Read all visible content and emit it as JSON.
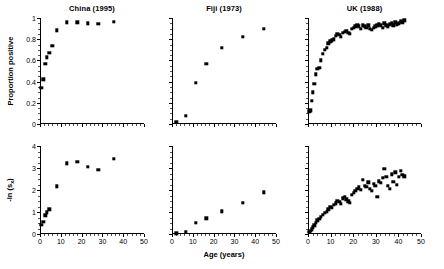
{
  "figure": {
    "axis_titles": {
      "y_top": "Proportion positive",
      "y_bottom": "-ln (s",
      "y_bottom_sub": "x",
      "y_bottom_tail": ")",
      "x": "Age (years)"
    },
    "marker_color": "#000000",
    "axis_color": "#000000"
  },
  "panels": [
    {
      "key": "china",
      "title": "China (1995)"
    },
    {
      "key": "fiji",
      "title": "Fiji (1973)"
    },
    {
      "key": "uk",
      "title": "UK (1988)"
    }
  ],
  "chart_data": [
    {
      "type": "scatter",
      "title": "China (1995)",
      "row": "top",
      "xlabel": "Age (years)",
      "ylabel": "Proportion positive",
      "xlim": [
        0,
        50
      ],
      "ylim": [
        0,
        1
      ],
      "xticks": [
        0,
        10,
        20,
        30,
        40,
        50
      ],
      "yticks": [
        0,
        0.2,
        0.4,
        0.6,
        0.8,
        1
      ],
      "xticklabels": [
        "0",
        "10",
        "20",
        "30",
        "40",
        "50"
      ],
      "yticklabels": [
        "0",
        "0.2",
        "0.4",
        "0.6",
        "0.8",
        "1"
      ],
      "grid": false,
      "legend": "none",
      "x": [
        0.7,
        1.6,
        2.6,
        3.4,
        4.5,
        6.0,
        8.0,
        13.0,
        18.0,
        23.0,
        28.0,
        35.5
      ],
      "y": [
        0.34,
        0.42,
        0.57,
        0.63,
        0.67,
        0.74,
        0.885,
        0.96,
        0.96,
        0.95,
        0.945,
        0.965
      ]
    },
    {
      "type": "scatter",
      "title": "Fiji (1973)",
      "row": "top",
      "xlabel": "Age (years)",
      "ylabel": "Proportion positive",
      "xlim": [
        0,
        50
      ],
      "ylim": [
        0,
        1
      ],
      "xticks": [
        0,
        10,
        20,
        30,
        40,
        50
      ],
      "yticks": [
        0,
        0.2,
        0.4,
        0.6,
        0.8,
        1
      ],
      "xticklabels": [
        "0",
        "10",
        "20",
        "30",
        "40",
        "50"
      ],
      "yticklabels": [
        "0",
        "0.2",
        "0.4",
        "0.6",
        "0.8",
        "1"
      ],
      "grid": false,
      "legend": "none",
      "x": [
        2.0,
        6.5,
        11.5,
        16.5,
        24.0,
        34.0,
        44.0
      ],
      "y": [
        0.02,
        0.08,
        0.39,
        0.57,
        0.72,
        0.82,
        0.9
      ]
    },
    {
      "type": "scatter",
      "title": "UK (1988)",
      "row": "top",
      "xlabel": "Age (years)",
      "ylabel": "Proportion positive",
      "xlim": [
        0,
        50
      ],
      "ylim": [
        0,
        1
      ],
      "xticks": [
        0,
        10,
        20,
        30,
        40,
        50
      ],
      "yticks": [
        0,
        0.2,
        0.4,
        0.6,
        0.8,
        1
      ],
      "xticklabels": [
        "0",
        "10",
        "20",
        "30",
        "40",
        "50"
      ],
      "yticklabels": [
        "0",
        "0.2",
        "0.4",
        "0.6",
        "0.8",
        "1"
      ],
      "grid": false,
      "legend": "none",
      "x": [
        0.6,
        1.0,
        1.6,
        2.2,
        2.8,
        3.4,
        4.2,
        5.0,
        5.8,
        6.6,
        7.4,
        8.2,
        9.0,
        9.8,
        10.6,
        11.4,
        12.2,
        13.0,
        13.8,
        14.6,
        15.4,
        16.2,
        17.0,
        17.8,
        18.6,
        19.4,
        20.2,
        21.0,
        21.8,
        22.6,
        23.4,
        24.2,
        25.0,
        25.8,
        26.6,
        27.4,
        28.2,
        29.0,
        29.8,
        30.6,
        31.4,
        32.2,
        33.0,
        33.8,
        34.6,
        35.4,
        36.2,
        37.0,
        37.8,
        38.6,
        39.4,
        40.2,
        41.0,
        41.8,
        42.6
      ],
      "y": [
        0.12,
        0.13,
        0.22,
        0.3,
        0.38,
        0.47,
        0.52,
        0.53,
        0.6,
        0.66,
        0.7,
        0.72,
        0.76,
        0.78,
        0.79,
        0.8,
        0.83,
        0.85,
        0.84,
        0.82,
        0.86,
        0.87,
        0.88,
        0.86,
        0.85,
        0.9,
        0.91,
        0.92,
        0.93,
        0.92,
        0.9,
        0.93,
        0.92,
        0.91,
        0.93,
        0.9,
        0.89,
        0.91,
        0.92,
        0.93,
        0.94,
        0.93,
        0.91,
        0.95,
        0.93,
        0.92,
        0.94,
        0.95,
        0.93,
        0.96,
        0.94,
        0.95,
        0.97,
        0.96,
        0.98
      ]
    },
    {
      "type": "scatter",
      "title": "China (1995)",
      "row": "bottom",
      "xlabel": "Age (years)",
      "ylabel": "-ln (sx)",
      "xlim": [
        0,
        50
      ],
      "ylim": [
        0,
        4
      ],
      "xticks": [
        0,
        10,
        20,
        30,
        40,
        50
      ],
      "yticks": [
        0,
        1,
        2,
        3,
        4
      ],
      "xticklabels": [
        "0",
        "10",
        "20",
        "30",
        "40",
        "50"
      ],
      "yticklabels": [
        "0",
        "1",
        "2",
        "3",
        "4"
      ],
      "grid": false,
      "legend": "none",
      "x": [
        0.7,
        1.6,
        2.6,
        3.4,
        4.5,
        8.0,
        13.0,
        18.0,
        23.0,
        28.0,
        35.5
      ],
      "y": [
        0.42,
        0.55,
        0.85,
        0.99,
        1.12,
        2.17,
        3.22,
        3.27,
        3.05,
        2.92,
        3.42
      ]
    },
    {
      "type": "scatter",
      "title": "Fiji (1973)",
      "row": "bottom",
      "xlabel": "Age (years)",
      "ylabel": "-ln (sx)",
      "xlim": [
        0,
        50
      ],
      "ylim": [
        0,
        4
      ],
      "xticks": [
        0,
        10,
        20,
        30,
        40,
        50
      ],
      "yticks": [
        0,
        1,
        2,
        3,
        4
      ],
      "xticklabels": [
        "0",
        "10",
        "20",
        "30",
        "40",
        "50"
      ],
      "yticklabels": [
        "0",
        "1",
        "2",
        "3",
        "4"
      ],
      "grid": false,
      "legend": "none",
      "x": [
        2.0,
        6.5,
        11.5,
        16.5,
        24.0,
        34.0,
        44.0
      ],
      "y": [
        0.03,
        0.09,
        0.5,
        0.72,
        1.03,
        1.42,
        1.9
      ]
    },
    {
      "type": "scatter",
      "title": "UK (1988)",
      "row": "bottom",
      "xlabel": "Age (years)",
      "ylabel": "-ln (sx)",
      "xlim": [
        0,
        50
      ],
      "ylim": [
        0,
        4
      ],
      "xticks": [
        0,
        10,
        20,
        30,
        40,
        50
      ],
      "yticks": [
        0,
        1,
        2,
        3,
        4
      ],
      "xticklabels": [
        "0",
        "10",
        "20",
        "30",
        "40",
        "50"
      ],
      "yticklabels": [
        "0",
        "1",
        "2",
        "3",
        "4"
      ],
      "grid": false,
      "legend": "none",
      "x": [
        0.6,
        1.0,
        1.6,
        2.2,
        2.8,
        3.4,
        4.2,
        5.0,
        5.8,
        6.6,
        7.4,
        8.2,
        9.0,
        9.8,
        10.6,
        11.4,
        12.2,
        13.0,
        13.8,
        14.6,
        15.4,
        16.2,
        17.0,
        17.8,
        18.6,
        19.4,
        20.2,
        21.0,
        21.8,
        22.6,
        23.4,
        24.2,
        25.0,
        25.8,
        26.6,
        27.4,
        28.2,
        29.0,
        29.8,
        30.6,
        31.4,
        32.2,
        33.0,
        33.8,
        34.6,
        35.4,
        36.2,
        37.0,
        37.8,
        38.6,
        39.4,
        40.2,
        41.0,
        41.8,
        42.6
      ],
      "y": [
        0.1,
        0.14,
        0.22,
        0.3,
        0.4,
        0.52,
        0.62,
        0.7,
        0.78,
        0.88,
        0.96,
        1.02,
        1.12,
        1.25,
        1.2,
        1.32,
        1.4,
        1.5,
        1.45,
        1.38,
        1.62,
        1.7,
        1.58,
        1.48,
        1.42,
        1.78,
        1.88,
        1.95,
        2.05,
        2.12,
        2.0,
        2.45,
        2.2,
        2.15,
        2.35,
        2.05,
        1.95,
        2.28,
        2.18,
        1.7,
        2.4,
        2.32,
        2.55,
        2.95,
        2.6,
        2.2,
        2.05,
        2.72,
        2.38,
        2.8,
        2.25,
        2.6,
        2.88,
        2.7,
        2.62
      ]
    }
  ]
}
